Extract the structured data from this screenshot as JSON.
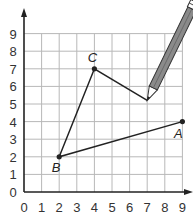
{
  "figure": {
    "x_ticks": [
      "0",
      "1",
      "2",
      "3",
      "4",
      "5",
      "6",
      "7",
      "8",
      "9"
    ],
    "y_ticks": [
      "0",
      "1",
      "2",
      "3",
      "4",
      "5",
      "6",
      "7",
      "8",
      "9"
    ],
    "x_range": [
      0,
      9
    ],
    "y_range": [
      0,
      9
    ],
    "grid": true,
    "points": [
      {
        "label": "A",
        "x": 9,
        "y": 4
      },
      {
        "label": "B",
        "x": 2,
        "y": 2
      },
      {
        "label": "C",
        "x": 4,
        "y": 7
      }
    ],
    "path": [
      {
        "x": 9,
        "y": 4
      },
      {
        "x": 2,
        "y": 2
      },
      {
        "x": 4,
        "y": 7
      },
      {
        "x": 7,
        "y": 5.2
      }
    ],
    "pencil_tip": {
      "x": 7,
      "y": 5.2
    },
    "colors": {
      "line": "#222222",
      "grid": "#b8b8b8",
      "pencil_body": "#8a8a8a",
      "pencil_outline": "#333333"
    }
  }
}
